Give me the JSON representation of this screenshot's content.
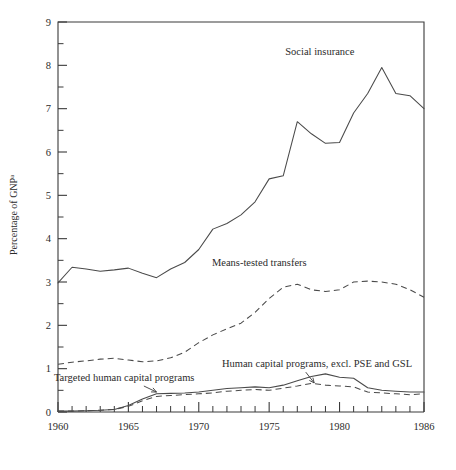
{
  "chart_data": {
    "type": "line",
    "title": "",
    "subtitle": "",
    "xlabel": "",
    "ylabel": "Percentage of GNP",
    "ylabel_superscript": "a",
    "xlim": [
      1960,
      1986
    ],
    "ylim": [
      0,
      9
    ],
    "grid": false,
    "legend_position": "inline-annotations",
    "y_ticks_major": [
      "0",
      "1",
      "2",
      "3",
      "4",
      "5",
      "6",
      "7",
      "8",
      "9"
    ],
    "y_ticks_minor": [
      "0.5",
      "1.5",
      "2.5",
      "3.5",
      "4.5",
      "5.5",
      "6.5",
      "7.5",
      "8.5"
    ],
    "x_ticks_all": [
      1960,
      1961,
      1962,
      1963,
      1964,
      1965,
      1966,
      1967,
      1968,
      1969,
      1970,
      1971,
      1972,
      1973,
      1974,
      1975,
      1976,
      1977,
      1978,
      1979,
      1980,
      1981,
      1982,
      1983,
      1984,
      1985,
      1986
    ],
    "x_tick_labels": [
      "1960",
      "1965",
      "1970",
      "1975",
      "1980",
      "1986"
    ],
    "x_tick_label_years": [
      1960,
      1965,
      1970,
      1975,
      1980,
      1986
    ],
    "x": [
      1960,
      1961,
      1962,
      1963,
      1964,
      1965,
      1966,
      1967,
      1968,
      1969,
      1970,
      1971,
      1972,
      1973,
      1974,
      1975,
      1976,
      1977,
      1978,
      1979,
      1980,
      1981,
      1982,
      1983,
      1984,
      1985,
      1986
    ],
    "series": [
      {
        "name": "Social insurance",
        "style": "solid",
        "color": "#4a4a4a",
        "label_position": {
          "year": 1978.6,
          "value": 8.25
        },
        "values": [
          2.98,
          3.34,
          3.3,
          3.25,
          3.28,
          3.32,
          3.2,
          3.1,
          3.3,
          3.45,
          3.75,
          4.22,
          4.35,
          4.55,
          4.85,
          5.38,
          5.45,
          6.7,
          6.42,
          6.2,
          6.22,
          6.9,
          7.35,
          7.95,
          7.35,
          7.3,
          7.0
        ]
      },
      {
        "name": "Means-tested transfers",
        "style": "dashed",
        "color": "#4a4a4a",
        "label_position": {
          "year": 1974.3,
          "value": 3.36
        },
        "values": [
          1.1,
          1.15,
          1.18,
          1.22,
          1.24,
          1.2,
          1.16,
          1.18,
          1.25,
          1.38,
          1.6,
          1.78,
          1.92,
          2.05,
          2.3,
          2.62,
          2.88,
          2.95,
          2.82,
          2.78,
          2.82,
          3.0,
          3.02,
          3.0,
          2.95,
          2.82,
          2.65
        ]
      },
      {
        "name": "Human capital programs, excl. PSE and GSL",
        "style": "solid",
        "color": "#4a4a4a",
        "label_position": {
          "year": 1978.4,
          "value": 1.05
        },
        "values": [
          0.02,
          0.02,
          0.03,
          0.04,
          0.06,
          0.15,
          0.3,
          0.42,
          0.43,
          0.44,
          0.46,
          0.5,
          0.54,
          0.56,
          0.58,
          0.56,
          0.62,
          0.72,
          0.82,
          0.88,
          0.8,
          0.78,
          0.56,
          0.5,
          0.48,
          0.46,
          0.46
        ]
      },
      {
        "name": "Targeted human capital programs",
        "style": "dashed",
        "color": "#4a4a4a",
        "label_position": {
          "year": 1964.7,
          "value": 0.72
        },
        "values": [
          0.02,
          0.02,
          0.03,
          0.04,
          0.06,
          0.13,
          0.26,
          0.36,
          0.38,
          0.4,
          0.42,
          0.44,
          0.48,
          0.5,
          0.52,
          0.5,
          0.55,
          0.6,
          0.66,
          0.62,
          0.6,
          0.58,
          0.46,
          0.44,
          0.42,
          0.4,
          0.42
        ]
      }
    ],
    "annotations": [
      {
        "text": "Social insurance",
        "anchor": "middle"
      },
      {
        "text": "Means-tested transfers",
        "anchor": "middle"
      },
      {
        "text": "Human capital programs, excl. PSE and GSL",
        "anchor": "middle"
      },
      {
        "text": "Targeted human capital programs",
        "anchor": "middle"
      }
    ]
  }
}
